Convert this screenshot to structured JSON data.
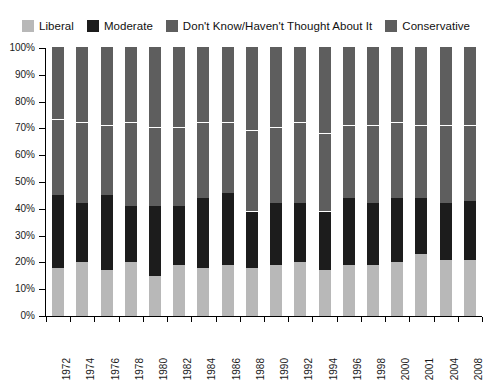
{
  "legend": {
    "position": "top",
    "items": [
      {
        "label": "Liberal",
        "color": "#b8b8b8",
        "icon": "legend-swatch-icon"
      },
      {
        "label": "Moderate",
        "color": "#1c1c1c",
        "icon": "legend-swatch-icon"
      },
      {
        "label": "Don't Know/Haven't Thought About It",
        "color": "#5e5e5e",
        "icon": "legend-swatch-icon"
      },
      {
        "label": "Conservative",
        "color": "#5e5e5e",
        "icon": "legend-swatch-icon"
      }
    ]
  },
  "axes": {
    "y_tick_labels": [
      "100%",
      "90%",
      "80%",
      "70%",
      "60%",
      "50%",
      "40%",
      "30%",
      "20%",
      "10%",
      "0%"
    ],
    "y_min": 0,
    "y_max": 100,
    "y_step": 10,
    "grid": false
  },
  "chart_data": {
    "type": "bar",
    "stacked": true,
    "stack_total": 100,
    "title": "",
    "subtitle": "",
    "xlabel": "",
    "ylabel": "",
    "ylim": [
      0,
      100
    ],
    "ytick_labels": [
      "0%",
      "10%",
      "20%",
      "30%",
      "40%",
      "50%",
      "60%",
      "70%",
      "80%",
      "90%",
      "100%"
    ],
    "legend_position": "top",
    "categories": [
      "1972",
      "1974",
      "1976",
      "1978",
      "1980",
      "1982",
      "1984",
      "1986",
      "1988",
      "1990",
      "1992",
      "1994",
      "1996",
      "1998",
      "2000",
      "2001",
      "2004",
      "2008"
    ],
    "series": [
      {
        "name": "Liberal",
        "color": "#b8b8b8",
        "values": [
          18,
          20,
          17,
          20,
          15,
          19,
          18,
          19,
          18,
          19,
          20,
          17,
          19,
          19,
          20,
          23,
          21,
          21
        ]
      },
      {
        "name": "Moderate",
        "color": "#1c1c1c",
        "values": [
          27,
          22,
          28,
          21,
          26,
          22,
          26,
          27,
          21,
          23,
          22,
          22,
          25,
          23,
          24,
          21,
          21,
          22
        ]
      },
      {
        "name": "Don't Know/Haven't Thought About It",
        "color": "#5e5e5e",
        "values": [
          28,
          30,
          26,
          31,
          29,
          29,
          28,
          26,
          30,
          28,
          30,
          29,
          27,
          29,
          28,
          27,
          29,
          28
        ]
      },
      {
        "name": "Conservative",
        "color": "#5e5e5e",
        "values": [
          27,
          28,
          29,
          28,
          30,
          30,
          28,
          28,
          31,
          30,
          28,
          32,
          29,
          29,
          28,
          29,
          29,
          29
        ]
      }
    ]
  }
}
